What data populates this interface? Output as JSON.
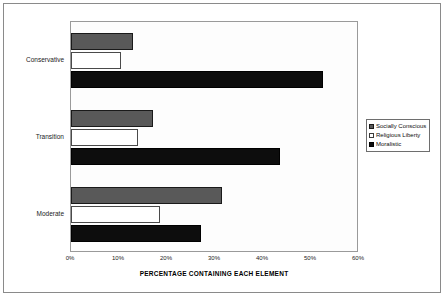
{
  "chart_data": {
    "type": "bar",
    "orientation": "horizontal",
    "title": "",
    "xlabel": "PERCENTAGE CONTAINING EACH ELEMENT",
    "ylabel": "ERA",
    "categories": [
      "Conservative",
      "Transition",
      "Moderate"
    ],
    "xlim": [
      0,
      60
    ],
    "xticks": [
      0,
      10,
      20,
      30,
      40,
      50,
      60
    ],
    "xticklabels": [
      "0%",
      "10%",
      "20%",
      "30%",
      "40%",
      "50%",
      "60%"
    ],
    "grid": false,
    "legend_position": "right",
    "series": [
      {
        "name": "Socially Conscious",
        "color": "#595959",
        "values": [
          13,
          17,
          31.5
        ]
      },
      {
        "name": "Religious Liberty",
        "color": "#ffffff",
        "values": [
          10.5,
          14,
          18.5
        ]
      },
      {
        "name": "Moralistic",
        "color": "#0d0d0d",
        "values": [
          52.5,
          43.5,
          27
        ]
      }
    ]
  },
  "legend": {
    "items": [
      {
        "label": "Socially Conscious"
      },
      {
        "label": "Religious Liberty"
      },
      {
        "label": "Moralistic"
      }
    ]
  },
  "axes": {
    "x_title": "PERCENTAGE CONTAINING EACH ELEMENT",
    "y_title": "ERA",
    "x_tick_labels": [
      "0%",
      "10%",
      "20%",
      "30%",
      "40%",
      "50%",
      "60%"
    ],
    "y_tick_labels": [
      "Conservative",
      "Transition",
      "Moderate"
    ]
  }
}
